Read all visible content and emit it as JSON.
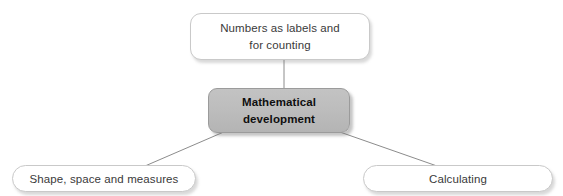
{
  "diagram": {
    "canvas": {
      "width": 563,
      "height": 196,
      "background": "#ffffff"
    },
    "nodes": {
      "top": {
        "id": "numbers-as-labels-and-for-counting",
        "label": "Numbers as labels and\nfor counting",
        "line1": "Numbers as labels and",
        "line2": "for counting",
        "shape": "rounded-rectangle",
        "fill": "#ffffff",
        "border_color": "#c9c9c9",
        "text_color": "#3a3a3a",
        "bold": "false"
      },
      "center": {
        "id": "mathematical-development",
        "label": "Mathematical\ndevelopment",
        "line1": "Mathematical",
        "line2": "development",
        "shape": "rounded-rectangle",
        "fill": "#bdbdbd",
        "border_color": "#9b9b9b",
        "text_color": "#0f0f0f",
        "bold": "true"
      },
      "bottom_left": {
        "id": "shape-space-and-measures",
        "label": "Shape, space and measures",
        "shape": "pill",
        "fill": "#ffffff",
        "border_color": "#c9c9c9",
        "text_color": "#3a3a3a",
        "bold": "false"
      },
      "bottom_right": {
        "id": "calculating",
        "label": "Calculating",
        "shape": "pill",
        "fill": "#ffffff",
        "border_color": "#c9c9c9",
        "text_color": "#3a3a3a",
        "bold": "false"
      }
    },
    "connectors": [
      {
        "id": "connector-center-to-top",
        "from": "center",
        "to": "top",
        "x1": 284,
        "y1": 88,
        "x2": 284,
        "y2": 60,
        "color": "#8c8c8c",
        "width": 1
      },
      {
        "id": "connector-center-to-bottom-left",
        "from": "center",
        "to": "bottom_left",
        "x1": 226,
        "y1": 131,
        "x2": 145,
        "y2": 166,
        "color": "#8c8c8c",
        "width": 1
      },
      {
        "id": "connector-center-to-bottom-right",
        "from": "center",
        "to": "bottom_right",
        "x1": 337,
        "y1": 131,
        "x2": 437,
        "y2": 166,
        "color": "#8c8c8c",
        "width": 1
      }
    ]
  }
}
